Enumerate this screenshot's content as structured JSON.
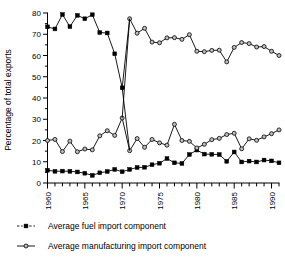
{
  "chart_data": {
    "type": "line",
    "title": "",
    "xlabel": "",
    "ylabel": "Percentage of total exports",
    "xlim": [
      1960,
      1991
    ],
    "ylim": [
      0,
      80
    ],
    "yticks": [
      0,
      10,
      20,
      30,
      40,
      50,
      60,
      70,
      80
    ],
    "ytick_labels": [
      "0",
      "10",
      "20",
      "30",
      "40",
      "50",
      "60",
      "70",
      "80"
    ],
    "y_minor_tick_step": 5,
    "xticks": [
      1960,
      1965,
      1970,
      1975,
      1980,
      1985,
      1990
    ],
    "xtick_labels": [
      "1960",
      "1965",
      "1970",
      "1975",
      "1980",
      "1985",
      "1990"
    ],
    "x_minor_tick_step": 1,
    "grid": false,
    "legend_position": "below",
    "x": [
      1960,
      1961,
      1962,
      1963,
      1964,
      1965,
      1966,
      1967,
      1968,
      1969,
      1970,
      1971,
      1972,
      1973,
      1974,
      1975,
      1976,
      1977,
      1978,
      1979,
      1980,
      1981,
      1982,
      1983,
      1984,
      1985,
      1986,
      1987,
      1988,
      1989,
      1990,
      1991
    ],
    "series": [
      {
        "name": "Average fuel import component",
        "marker": "square",
        "values": [
          6.0,
          5.5,
          5.6,
          5.5,
          5.2,
          4.6,
          3.6,
          4.8,
          5.4,
          6.4,
          5.3,
          6.4,
          7.3,
          7.4,
          8.6,
          9.3,
          11.5,
          9.5,
          9.2,
          13.4,
          15.5,
          13.6,
          13.5,
          13.4,
          10.2,
          14.6,
          9.9,
          10.3,
          9.9,
          10.8,
          10.4,
          9.5
        ]
      },
      {
        "name": "Average manufacturing import component",
        "marker": "circle",
        "values": [
          20.0,
          20.5,
          14.8,
          19.7,
          14.7,
          16.0,
          15.6,
          22.2,
          24.6,
          22.4,
          30.6,
          15.2,
          20.9,
          16.8,
          20.5,
          18.9,
          17.8,
          27.6,
          20.0,
          19.6,
          16.5,
          18.2,
          20.4,
          21.0,
          22.8,
          23.4,
          16.1,
          20.8,
          20.1,
          21.7,
          23.2,
          25.0
        ]
      },
      {
        "name": "Upper band A",
        "marker": "square",
        "values": [
          73.5,
          72.5,
          79.3,
          73.6,
          78.9,
          77.3,
          79.2,
          70.8,
          70.6,
          60.8,
          44.8,
          null,
          null,
          null,
          null,
          null,
          null,
          null,
          null,
          null,
          null,
          null,
          null,
          null,
          null,
          null,
          null,
          null,
          null,
          null,
          null,
          null
        ]
      },
      {
        "name": "Upper band B",
        "marker": "circle",
        "values": [
          null,
          null,
          null,
          null,
          null,
          null,
          null,
          null,
          null,
          null,
          null,
          77.3,
          70.5,
          72.8,
          66.3,
          66.0,
          68.3,
          68.4,
          67.6,
          69.8,
          62.0,
          61.8,
          62.4,
          62.5,
          57.0,
          63.8,
          66.1,
          65.6,
          64.0,
          64.2,
          62.0,
          60.0
        ]
      }
    ],
    "legend": [
      {
        "label": "Average fuel import component",
        "marker": "square",
        "line": "dashed"
      },
      {
        "label": "Average manufacturing import component",
        "marker": "circle",
        "line": "solid"
      }
    ],
    "colors": {
      "line": "#000000",
      "marker_fill_square": "#000000",
      "marker_fill_circle": "#bdbdbd",
      "background": "#ffffff"
    }
  }
}
